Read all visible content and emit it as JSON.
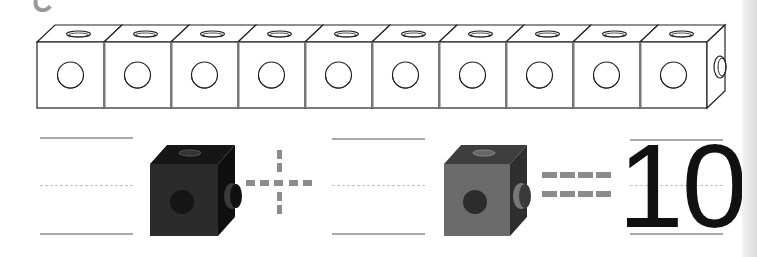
{
  "worksheet": {
    "cube_train": {
      "cube_count": 10,
      "cube_color": "#ffffff",
      "outline_color": "#222222"
    },
    "equation": {
      "first_blank": "",
      "first_cube_color": "#2a2a2a",
      "operator_plus": "+",
      "second_blank": "",
      "second_cube_color": "#6b6b6b",
      "operator_equals": "=",
      "result": "10"
    },
    "colors": {
      "guide_line": "#a9a9a9",
      "dashed_guide": "#c4c4c4",
      "operator": "#8c8c8c"
    }
  }
}
